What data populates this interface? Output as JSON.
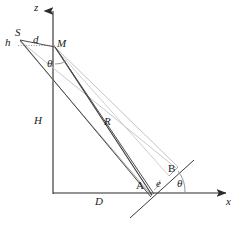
{
  "figure": {
    "background_color": "#ffffff",
    "width": 237,
    "height": 226,
    "axes": {
      "vertical_axis_label": "z",
      "horizontal_axis_label": "x",
      "origin_x": 53,
      "origin_y": 193
    },
    "colors": {
      "dark_line": "#3a3a3a",
      "mid_line": "#6e6e6e",
      "light_line": "#b9b9b9",
      "axis": "#2b2b2b",
      "text": "#1a1a1a"
    },
    "labels": {
      "source": "S",
      "height_small": "h",
      "offset": "d",
      "mirror_point": "M",
      "angle_top": "θ",
      "height_big": "H",
      "range": "R",
      "distance": "D",
      "point_a": "A",
      "point_b": "B",
      "eccentricity": "e",
      "angle_bottom": "θ",
      "axis_z": "z",
      "axis_x": "x"
    },
    "elements": {
      "z_axis": "vertical-axis-with-arrow",
      "x_axis": "horizontal-axis-with-arrow",
      "dashed_segment": "dotted-horizontal-segment-h-to-M",
      "ray_bundle_dark": "dark-ray-pair-M-to-A",
      "ray_bundle_light": "light-ray-pair-M-to-B",
      "inclined_surface": "tilted-ground-line-through-A",
      "angle_arc_top": "theta-arc-at-M",
      "angle_arc_bottom": "theta-arc-at-ground-intersection"
    }
  }
}
